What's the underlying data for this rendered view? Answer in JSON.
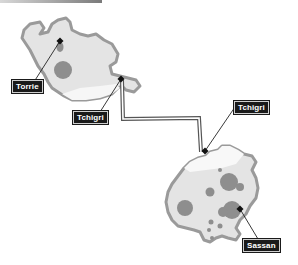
{
  "map": {
    "colors": {
      "land_fill": "#e4e4e4",
      "land_border": "#9a9a9a",
      "crater_fill": "#8e8e8e",
      "label_bg": "#1a1a1a",
      "label_text": "#ffffff",
      "route_line": "#555555"
    },
    "regions": [
      {
        "name": "northwest-island"
      },
      {
        "name": "southeast-island"
      }
    ],
    "labels": [
      {
        "id": "torrie",
        "text": "Torrie"
      },
      {
        "id": "tchigri-west",
        "text": "Tchigri"
      },
      {
        "id": "tchigri-east",
        "text": "Tchigri"
      },
      {
        "id": "sassan",
        "text": "Sassan"
      }
    ]
  }
}
